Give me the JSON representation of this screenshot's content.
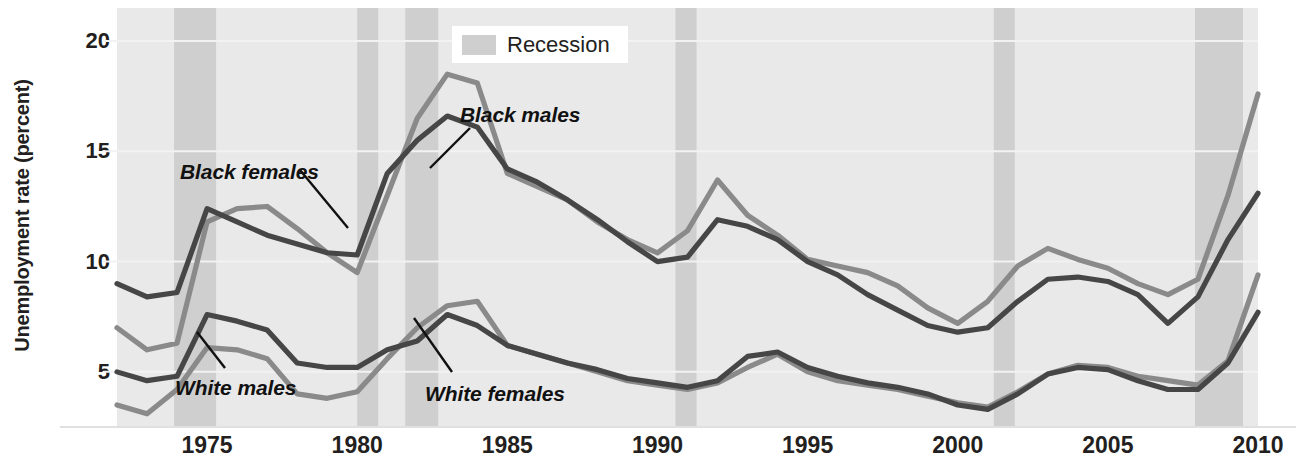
{
  "chart_data": {
    "type": "line",
    "title": "",
    "xlabel": "",
    "ylabel": "Unemployment rate (percent)",
    "xlim": [
      1972,
      2010
    ],
    "ylim": [
      2.5,
      21.5
    ],
    "yticks": [
      5,
      10,
      15,
      20
    ],
    "ytick_labels": [
      "5",
      "10",
      "15",
      "20"
    ],
    "xticks": [
      1975,
      1980,
      1985,
      1990,
      1995,
      2000,
      2005,
      2010
    ],
    "xtick_labels": [
      "1975",
      "1980",
      "1985",
      "1990",
      "1995",
      "2000",
      "2005",
      "2010"
    ],
    "grid": "horizontal",
    "legend_position": "top-center",
    "x": [
      1972,
      1973,
      1974,
      1975,
      1976,
      1977,
      1978,
      1979,
      1980,
      1981,
      1982,
      1983,
      1984,
      1985,
      1986,
      1987,
      1988,
      1989,
      1990,
      1991,
      1992,
      1993,
      1994,
      1995,
      1996,
      1997,
      1998,
      1999,
      2000,
      2001,
      2002,
      2003,
      2004,
      2005,
      2006,
      2007,
      2008,
      2009,
      2010
    ],
    "series": [
      {
        "name": "Black females",
        "color": "#8a8a8a",
        "values": [
          7.0,
          6.0,
          6.3,
          11.8,
          12.4,
          12.5,
          11.5,
          10.4,
          9.5,
          13.0,
          16.5,
          18.5,
          18.1,
          14.0,
          13.4,
          12.8,
          11.8,
          11.0,
          10.4,
          11.4,
          13.7,
          12.1,
          11.2,
          10.1,
          9.8,
          9.5,
          8.9,
          7.9,
          7.2,
          8.2,
          9.8,
          10.6,
          10.1,
          9.7,
          9.0,
          8.5,
          9.2,
          13.0,
          17.6
        ]
      },
      {
        "name": "Black males",
        "color": "#464646",
        "values": [
          9.0,
          8.4,
          8.6,
          12.4,
          11.8,
          11.2,
          10.8,
          10.4,
          10.3,
          14.0,
          15.5,
          16.6,
          16.1,
          14.2,
          13.6,
          12.8,
          11.9,
          10.9,
          10.0,
          10.2,
          11.9,
          11.6,
          11.0,
          10.0,
          9.4,
          8.5,
          7.8,
          7.1,
          6.8,
          7.0,
          8.2,
          9.2,
          9.3,
          9.1,
          8.5,
          7.2,
          8.4,
          11.0,
          13.1
        ]
      },
      {
        "name": "White females",
        "color": "#8a8a8a",
        "values": [
          3.5,
          3.1,
          4.2,
          6.1,
          6.0,
          5.6,
          4.0,
          3.8,
          4.1,
          5.6,
          7.0,
          8.0,
          8.2,
          6.2,
          5.8,
          5.4,
          5.0,
          4.6,
          4.4,
          4.2,
          4.5,
          5.2,
          5.8,
          5.0,
          4.6,
          4.4,
          4.2,
          3.9,
          3.6,
          3.4,
          4.1,
          4.9,
          5.3,
          5.2,
          4.8,
          4.6,
          4.4,
          5.5,
          9.4
        ]
      },
      {
        "name": "White males",
        "color": "#464646",
        "values": [
          5.0,
          4.6,
          4.8,
          7.6,
          7.3,
          6.9,
          5.4,
          5.2,
          5.2,
          6.0,
          6.4,
          7.6,
          7.1,
          6.2,
          5.8,
          5.4,
          5.1,
          4.7,
          4.5,
          4.3,
          4.6,
          5.7,
          5.9,
          5.2,
          4.8,
          4.5,
          4.3,
          4.0,
          3.5,
          3.3,
          4.0,
          4.9,
          5.2,
          5.1,
          4.6,
          4.2,
          4.2,
          5.4,
          7.7
        ]
      }
    ],
    "recessions": [
      {
        "start": 1973.9,
        "end": 1975.3
      },
      {
        "start": 1980.0,
        "end": 1980.7
      },
      {
        "start": 1981.6,
        "end": 1982.7
      },
      {
        "start": 1990.6,
        "end": 1991.3
      },
      {
        "start": 2001.2,
        "end": 2001.9
      },
      {
        "start": 2007.9,
        "end": 2009.5
      }
    ],
    "legend": [
      {
        "label": "Recession",
        "color": "#cfcfcf"
      }
    ],
    "annotations": [
      {
        "label": "Black females",
        "x": 180,
        "y": 160
      },
      {
        "label": "Black males",
        "x": 460,
        "y": 103
      },
      {
        "label": "White males",
        "x": 175,
        "y": 376
      },
      {
        "label": "White females",
        "x": 425,
        "y": 382
      }
    ]
  },
  "colors": {
    "plot_background": "#e9e9e9",
    "page_background": "#ffffff",
    "recession_band": "#cfcfcf",
    "gridline": "#f2f2f2",
    "axis_line": "#e0e0e0",
    "dark_series": "#464646",
    "light_series": "#8a8a8a",
    "text": "#231f20"
  }
}
